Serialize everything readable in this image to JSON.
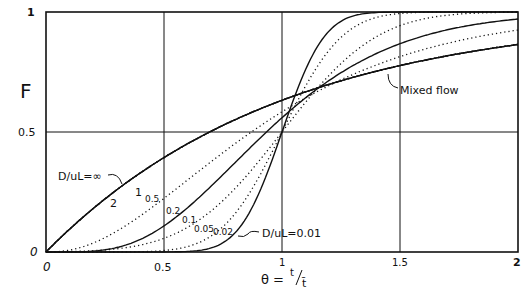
{
  "chart_data": {
    "type": "line",
    "title": "",
    "xlabel": "θ = t / t̄",
    "ylabel": "F",
    "xlim": [
      0,
      2
    ],
    "ylim": [
      0,
      1
    ],
    "grid": true,
    "x_ticks": [
      "0",
      "0.5",
      "1",
      "1.5",
      "2"
    ],
    "y_ticks": [
      "0",
      "0.5",
      "1"
    ],
    "series": [
      {
        "name": "D/uL = ∞ (Mixed flow)",
        "style": "solid",
        "dispersion": "inf"
      },
      {
        "name": "2",
        "style": "dotted",
        "dispersion": 2
      },
      {
        "name": "1",
        "style": "solid",
        "dispersion": 1
      },
      {
        "name": "0.5",
        "style": "dotted",
        "dispersion": 0.5
      },
      {
        "name": "0.2",
        "style": "dotted",
        "dispersion": 0.2
      },
      {
        "name": "0.1",
        "style": "solid",
        "dispersion": 0.1
      },
      {
        "name": "0.05",
        "style": "dotted",
        "dispersion": 0.05
      },
      {
        "name": "0.02",
        "style": "dotted",
        "dispersion": 0.02
      },
      {
        "name": "D/uL = 0.01",
        "style": "solid",
        "dispersion": 0.01
      }
    ],
    "annotations": [
      {
        "text": "D/uL=∞",
        "x": 0.12,
        "y": 0.31
      },
      {
        "text": "2",
        "x": 0.33,
        "y": 0.17
      },
      {
        "text": "1",
        "x": 0.43,
        "y": 0.22
      },
      {
        "text": "0.5",
        "x": 0.48,
        "y": 0.18
      },
      {
        "text": "0.2",
        "x": 0.63,
        "y": 0.12
      },
      {
        "text": "0.1",
        "x": 0.71,
        "y": 0.1
      },
      {
        "text": "0.05",
        "x": 0.77,
        "y": 0.06
      },
      {
        "text": "0.02",
        "x": 0.85,
        "y": 0.03
      },
      {
        "text": "D/uL=0.01",
        "x": 1.02,
        "y": 0.05
      },
      {
        "text": "Mixed flow",
        "x": 1.25,
        "y": 0.69
      }
    ]
  },
  "labels": {
    "y_axis": "F",
    "x_axis_theta": "θ =",
    "x_axis_t": "t",
    "x_axis_tbar": "t̄",
    "mixed_flow": "Mixed flow",
    "d_inf": "D/uL=∞",
    "d_001": "D/uL=0.01",
    "c2": "2",
    "c1": "1",
    "c05": "0.5",
    "c02": "0.2",
    "c01": "0.1",
    "c005": "0.05",
    "c002": "0.02",
    "x0": "0",
    "x05": "0.5",
    "x1": "1",
    "x15": "1.5",
    "x2": "2",
    "y0": "0",
    "y05": "0.5",
    "y1": "1"
  }
}
